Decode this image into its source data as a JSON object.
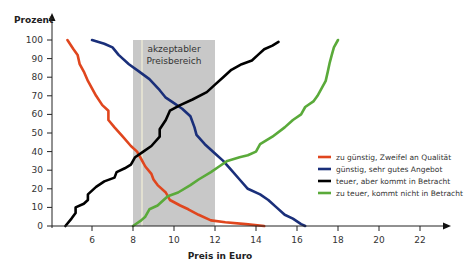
{
  "chart_data": {
    "type": "line",
    "title": "",
    "xlabel": "Preis in Euro",
    "ylabel": "Prozent",
    "xlim": [
      4,
      23
    ],
    "ylim": [
      0,
      100
    ],
    "x_ticks": [
      6,
      8,
      10,
      12,
      14,
      16,
      18,
      20,
      22
    ],
    "y_ticks": [
      0,
      10,
      20,
      30,
      40,
      50,
      60,
      70,
      80,
      90,
      100
    ],
    "grid": false,
    "legend_position": "right",
    "annotations": [
      {
        "type": "band",
        "x_from": 8,
        "x_to": 12,
        "label_line1": "akzeptabler",
        "label_line2": "Preisbereich",
        "color": "#c8c8c8"
      }
    ],
    "series": [
      {
        "name": "zu günstig, Zweifel an Qualität",
        "color": "#e0461e",
        "points": [
          [
            4.8,
            100
          ],
          [
            5.1,
            95
          ],
          [
            5.3,
            92
          ],
          [
            5.4,
            87
          ],
          [
            5.6,
            83
          ],
          [
            5.8,
            78
          ],
          [
            6.0,
            74
          ],
          [
            6.2,
            70
          ],
          [
            6.5,
            65
          ],
          [
            6.8,
            62
          ],
          [
            6.8,
            57
          ],
          [
            7.1,
            53
          ],
          [
            7.5,
            48
          ],
          [
            7.9,
            43
          ],
          [
            8.2,
            40
          ],
          [
            8.4,
            36
          ],
          [
            8.6,
            32
          ],
          [
            8.9,
            28
          ],
          [
            9.0,
            25
          ],
          [
            9.2,
            22
          ],
          [
            9.6,
            18
          ],
          [
            9.8,
            14
          ],
          [
            10.3,
            11
          ],
          [
            10.7,
            9
          ],
          [
            11.2,
            6
          ],
          [
            11.8,
            3
          ],
          [
            12.5,
            2
          ],
          [
            13.5,
            1
          ],
          [
            14.4,
            0
          ]
        ]
      },
      {
        "name": "günstig, sehr gutes Angebot",
        "color": "#1a2f7a",
        "points": [
          [
            6.0,
            100
          ],
          [
            6.6,
            98
          ],
          [
            7.0,
            96
          ],
          [
            7.3,
            92
          ],
          [
            7.8,
            87
          ],
          [
            8.3,
            83
          ],
          [
            8.8,
            79
          ],
          [
            9.3,
            73
          ],
          [
            9.6,
            69
          ],
          [
            10.0,
            66
          ],
          [
            10.4,
            63
          ],
          [
            10.8,
            59
          ],
          [
            11.0,
            53
          ],
          [
            11.1,
            49
          ],
          [
            11.5,
            44
          ],
          [
            12.0,
            39
          ],
          [
            12.4,
            35
          ],
          [
            12.8,
            30
          ],
          [
            13.2,
            25
          ],
          [
            13.6,
            20
          ],
          [
            14.2,
            17
          ],
          [
            14.6,
            14
          ],
          [
            15.0,
            10
          ],
          [
            15.4,
            6
          ],
          [
            15.8,
            4
          ],
          [
            16.2,
            1
          ],
          [
            16.4,
            0
          ]
        ]
      },
      {
        "name": "teuer, aber kommt in Betracht",
        "color": "#000000",
        "points": [
          [
            4.7,
            0
          ],
          [
            5.0,
            4
          ],
          [
            5.2,
            7
          ],
          [
            5.2,
            10
          ],
          [
            5.6,
            12
          ],
          [
            5.8,
            14
          ],
          [
            5.8,
            17
          ],
          [
            6.2,
            21
          ],
          [
            6.6,
            24
          ],
          [
            7.1,
            26
          ],
          [
            7.2,
            29
          ],
          [
            7.6,
            31
          ],
          [
            7.9,
            33
          ],
          [
            8.1,
            37
          ],
          [
            8.5,
            40
          ],
          [
            8.9,
            43
          ],
          [
            9.3,
            48
          ],
          [
            9.3,
            52
          ],
          [
            9.6,
            57
          ],
          [
            9.8,
            62
          ],
          [
            10.3,
            65
          ],
          [
            10.9,
            68
          ],
          [
            11.6,
            72
          ],
          [
            12.0,
            76
          ],
          [
            12.4,
            80
          ],
          [
            12.8,
            84
          ],
          [
            13.3,
            87
          ],
          [
            13.8,
            89
          ],
          [
            14.1,
            92
          ],
          [
            14.4,
            95
          ],
          [
            14.8,
            97
          ],
          [
            15.1,
            99
          ]
        ]
      },
      {
        "name": "zu teuer, kommt nicht in Betracht",
        "color": "#5aaa3a",
        "points": [
          [
            8.0,
            0
          ],
          [
            8.4,
            3
          ],
          [
            8.6,
            5
          ],
          [
            8.8,
            9
          ],
          [
            9.2,
            11
          ],
          [
            9.4,
            13
          ],
          [
            9.7,
            16
          ],
          [
            10.2,
            18
          ],
          [
            10.8,
            22
          ],
          [
            11.2,
            25
          ],
          [
            11.8,
            29
          ],
          [
            12.2,
            32
          ],
          [
            12.6,
            35
          ],
          [
            13.2,
            37
          ],
          [
            13.6,
            38
          ],
          [
            14.0,
            40
          ],
          [
            14.2,
            44
          ],
          [
            14.8,
            48
          ],
          [
            15.4,
            53
          ],
          [
            15.8,
            57
          ],
          [
            16.2,
            60
          ],
          [
            16.4,
            64
          ],
          [
            16.8,
            67
          ],
          [
            17.0,
            70
          ],
          [
            17.2,
            74
          ],
          [
            17.4,
            78
          ],
          [
            17.5,
            83
          ],
          [
            17.6,
            88
          ],
          [
            17.7,
            92
          ],
          [
            17.8,
            96
          ],
          [
            18.0,
            100
          ]
        ]
      }
    ]
  },
  "axes": {
    "y_title": "Prozent",
    "x_title": "Preis in Euro",
    "y_tick_labels": [
      "0",
      "10",
      "20",
      "30",
      "40",
      "50",
      "60",
      "70",
      "80",
      "90",
      "100"
    ],
    "x_tick_labels": [
      "6",
      "8",
      "10",
      "12",
      "14",
      "16",
      "18",
      "20",
      "22"
    ]
  },
  "band": {
    "label_line1": "akzeptabler",
    "label_line2": "Preisbereich"
  },
  "legend": {
    "items": [
      {
        "label": "zu günstig, Zweifel an Qualität",
        "color": "#e0461e"
      },
      {
        "label": "günstig, sehr gutes Angebot",
        "color": "#1a2f7a"
      },
      {
        "label": "teuer, aber kommt in Betracht",
        "color": "#000000"
      },
      {
        "label": "zu teuer, kommt nicht in Betracht",
        "color": "#5aaa3a"
      }
    ]
  }
}
